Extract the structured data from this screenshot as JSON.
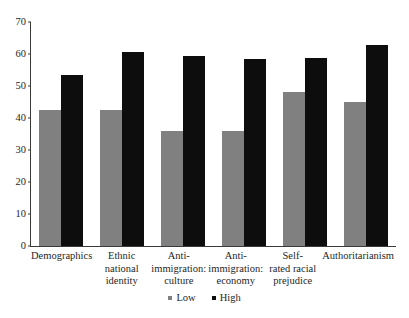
{
  "chart_data": {
    "type": "bar",
    "title": "",
    "subtitle": "",
    "xlabel": "",
    "ylabel": "",
    "ylim": [
      0,
      70
    ],
    "yticks": [
      0,
      10,
      20,
      30,
      40,
      50,
      60,
      70
    ],
    "ytick_labels": [
      "0",
      "10",
      "20",
      "30",
      "40",
      "50",
      "60",
      "70"
    ],
    "grid": false,
    "legend_position": "bottom-center",
    "categories": [
      "Demographics",
      "Ethnic national identity",
      "Anti-immigration: culture",
      "Anti-immigration: economy",
      "Self-rated racial prejudice",
      "Authoritarianism"
    ],
    "category_lines": [
      [
        "Demographics"
      ],
      [
        "Ethnic",
        "national",
        "identity"
      ],
      [
        "Anti-",
        "immigration:",
        "culture"
      ],
      [
        "Anti-",
        "immigration:",
        "economy"
      ],
      [
        "Self-",
        "rated racial",
        "prejudice"
      ],
      [
        "Authoritarianism"
      ]
    ],
    "series": [
      {
        "name": "Low",
        "color": "#808080",
        "values": [
          42.5,
          42.5,
          35.8,
          35.8,
          48.0,
          45.0
        ]
      },
      {
        "name": "High",
        "color": "#0d0d0d",
        "values": [
          53.5,
          60.5,
          59.5,
          58.5,
          58.8,
          62.8
        ]
      }
    ],
    "legend": [
      {
        "label": "Low",
        "color": "#808080"
      },
      {
        "label": "High",
        "color": "#0d0d0d"
      }
    ]
  },
  "axis": {
    "line_color": "#3a3a3a"
  }
}
